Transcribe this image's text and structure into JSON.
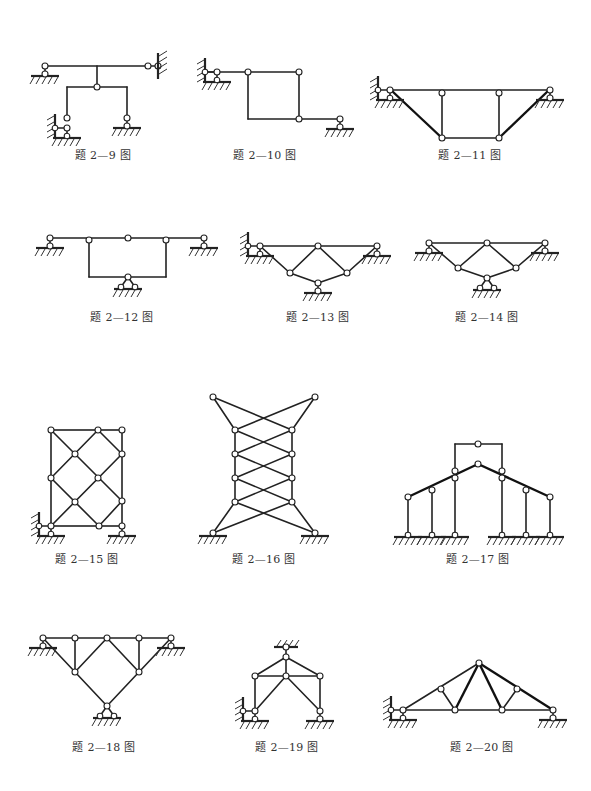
{
  "figures": [
    {
      "id": "2-9",
      "caption": "题 2—9 图",
      "type": "frame with hinges and fixed supports"
    },
    {
      "id": "2-10",
      "caption": "题 2—10 图",
      "type": "frame with hinge supports"
    },
    {
      "id": "2-11",
      "caption": "题 2—11 图",
      "type": "trapezoidal truss"
    },
    {
      "id": "2-12",
      "caption": "题 2—12 图",
      "type": "beam with suspended rectangular frame"
    },
    {
      "id": "2-13",
      "caption": "题 2—13 图",
      "type": "inverted triangle truss"
    },
    {
      "id": "2-14",
      "caption": "题 2—14 图",
      "type": "inverted triangle truss"
    },
    {
      "id": "2-15",
      "caption": "题 2—15 图",
      "type": "rectangular lattice truss"
    },
    {
      "id": "2-16",
      "caption": "题 2—16 图",
      "type": "cross-braced tower truss"
    },
    {
      "id": "2-17",
      "caption": "题 2—17 图",
      "type": "gable frame with columns"
    },
    {
      "id": "2-18",
      "caption": "题 2—18 图",
      "type": "inverted triangle truss"
    },
    {
      "id": "2-19",
      "caption": "题 2—19 图",
      "type": "truss frame with top support"
    },
    {
      "id": "2-20",
      "caption": "题 2—20 图",
      "type": "roof truss"
    }
  ]
}
